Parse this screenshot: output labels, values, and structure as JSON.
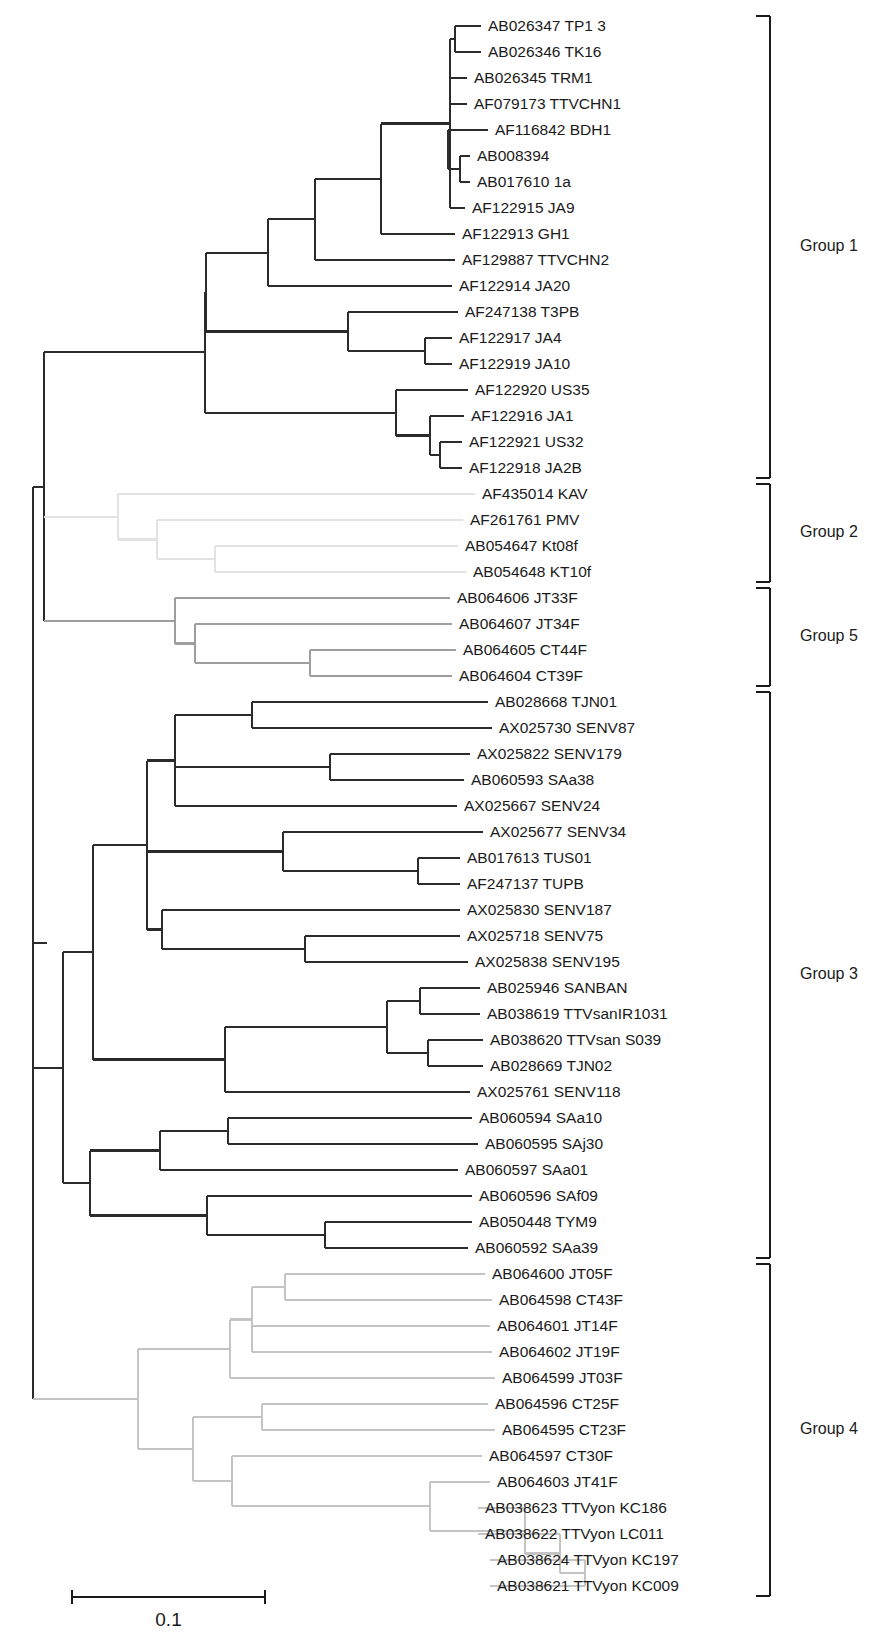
{
  "figure": {
    "type": "phylogenetic-tree",
    "orientation": "rectangular-horizontal-right",
    "scale_bar": {
      "label": "0.1",
      "value": 0.1,
      "x_start": 72,
      "x_end": 265,
      "y": 1597
    },
    "row_spacing_px": 26.0,
    "first_row_y": 26.0,
    "px_per_unit": 1930,
    "colors": {
      "group1": "#2b2b2b",
      "group2": "#e2e2e2",
      "group3": "#2b2b2b",
      "group4": "#c4c4c4",
      "group5": "#9e9e9e",
      "bracket": "#1a1a1a",
      "text": "#1a1a1a",
      "background": "#ffffff"
    }
  },
  "groups": [
    {
      "id": "group1",
      "label": "Group 1",
      "first_row": 1,
      "last_row": 18,
      "color": "#2b2b2b"
    },
    {
      "id": "group2",
      "label": "Group 2",
      "first_row": 19,
      "last_row": 22,
      "color": "#e2e2e2"
    },
    {
      "id": "group5",
      "label": "Group 5",
      "first_row": 23,
      "last_row": 26,
      "color": "#9e9e9e"
    },
    {
      "id": "group3",
      "label": "Group 3",
      "first_row": 27,
      "last_row": 48,
      "color": "#2b2b2b"
    },
    {
      "id": "group4",
      "label": "Group 4",
      "first_row": 49,
      "last_row": 61,
      "color": "#c4c4c4"
    }
  ],
  "taxa": [
    {
      "row": 1,
      "accession": "AB026347",
      "name": "TP1 3",
      "label": "AB026347 TP1 3",
      "group": "group1",
      "tip_x": 481
    },
    {
      "row": 2,
      "accession": "AB026346",
      "name": "TK16",
      "label": "AB026346 TK16",
      "group": "group1",
      "tip_x": 481
    },
    {
      "row": 3,
      "accession": "AB026345",
      "name": "TRM1",
      "label": "AB026345 TRM1",
      "group": "group1",
      "tip_x": 467
    },
    {
      "row": 4,
      "accession": "AF079173",
      "name": "TTVCHN1",
      "label": "AF079173 TTVCHN1",
      "group": "group1",
      "tip_x": 467
    },
    {
      "row": 5,
      "accession": "AF116842",
      "name": "BDH1",
      "label": "AF116842 BDH1",
      "group": "group1",
      "tip_x": 488
    },
    {
      "row": 6,
      "accession": "AB008394",
      "name": "",
      "label": "AB008394",
      "group": "group1",
      "tip_x": 470
    },
    {
      "row": 7,
      "accession": "AB017610",
      "name": "1a",
      "label": "AB017610 1a",
      "group": "group1",
      "tip_x": 470
    },
    {
      "row": 8,
      "accession": "AF122915",
      "name": "JA9",
      "label": "AF122915 JA9",
      "group": "group1",
      "tip_x": 465
    },
    {
      "row": 9,
      "accession": "AF122913",
      "name": "GH1",
      "label": "AF122913 GH1",
      "group": "group1",
      "tip_x": 455
    },
    {
      "row": 10,
      "accession": "AF129887",
      "name": "TTVCHN2",
      "label": "AF129887 TTVCHN2",
      "group": "group1",
      "tip_x": 455
    },
    {
      "row": 11,
      "accession": "AF122914",
      "name": "JA20",
      "label": "AF122914 JA20",
      "group": "group1",
      "tip_x": 452
    },
    {
      "row": 12,
      "accession": "AF247138",
      "name": "T3PB",
      "label": "AF247138 T3PB",
      "group": "group1",
      "tip_x": 458
    },
    {
      "row": 13,
      "accession": "AF122917",
      "name": "JA4",
      "label": "AF122917 JA4",
      "group": "group1",
      "tip_x": 452
    },
    {
      "row": 14,
      "accession": "AF122919",
      "name": "JA10",
      "label": "AF122919 JA10",
      "group": "group1",
      "tip_x": 452
    },
    {
      "row": 15,
      "accession": "AF122920",
      "name": "US35",
      "label": "AF122920 US35",
      "group": "group1",
      "tip_x": 468
    },
    {
      "row": 16,
      "accession": "AF122916",
      "name": "JA1",
      "label": "AF122916 JA1",
      "group": "group1",
      "tip_x": 464
    },
    {
      "row": 17,
      "accession": "AF122921",
      "name": "US32",
      "label": "AF122921 US32",
      "group": "group1",
      "tip_x": 462
    },
    {
      "row": 18,
      "accession": "AF122918",
      "name": "JA2B",
      "label": "AF122918 JA2B",
      "group": "group1",
      "tip_x": 462
    },
    {
      "row": 19,
      "accession": "AF435014",
      "name": "KAV",
      "label": "AF435014 KAV",
      "group": "group2",
      "tip_x": 475
    },
    {
      "row": 20,
      "accession": "AF261761",
      "name": "PMV",
      "label": "AF261761 PMV",
      "group": "group2",
      "tip_x": 463
    },
    {
      "row": 21,
      "accession": "AB054647",
      "name": "Kt08f",
      "label": "AB054647 Kt08f",
      "group": "group2",
      "tip_x": 458
    },
    {
      "row": 22,
      "accession": "AB054648",
      "name": "KT10f",
      "label": "AB054648 KT10f",
      "group": "group2",
      "tip_x": 466
    },
    {
      "row": 23,
      "accession": "AB064606",
      "name": "JT33F",
      "label": "AB064606 JT33F",
      "group": "group5",
      "tip_x": 450
    },
    {
      "row": 24,
      "accession": "AB064607",
      "name": "JT34F",
      "label": "AB064607 JT34F",
      "group": "group5",
      "tip_x": 452
    },
    {
      "row": 25,
      "accession": "AB064605",
      "name": "CT44F",
      "label": "AB064605 CT44F",
      "group": "group5",
      "tip_x": 456
    },
    {
      "row": 26,
      "accession": "AB064604",
      "name": "CT39F",
      "label": "AB064604 CT39F",
      "group": "group5",
      "tip_x": 452
    },
    {
      "row": 27,
      "accession": "AB028668",
      "name": "TJN01",
      "label": "AB028668 TJN01",
      "group": "group3",
      "tip_x": 488
    },
    {
      "row": 28,
      "accession": "AX025730",
      "name": "SENV87",
      "label": "AX025730 SENV87",
      "group": "group3",
      "tip_x": 492
    },
    {
      "row": 29,
      "accession": "AX025822",
      "name": "SENV179",
      "label": "AX025822 SENV179",
      "group": "group3",
      "tip_x": 470
    },
    {
      "row": 30,
      "accession": "AB060593",
      "name": "SAa38",
      "label": "AB060593 SAa38",
      "group": "group3",
      "tip_x": 464
    },
    {
      "row": 31,
      "accession": "AX025667",
      "name": "SENV24",
      "label": "AX025667 SENV24",
      "group": "group3",
      "tip_x": 457
    },
    {
      "row": 32,
      "accession": "AX025677",
      "name": "SENV34",
      "label": "AX025677 SENV34",
      "group": "group3",
      "tip_x": 483
    },
    {
      "row": 33,
      "accession": "AB017613",
      "name": "TUS01",
      "label": "AB017613 TUS01",
      "group": "group3",
      "tip_x": 460
    },
    {
      "row": 34,
      "accession": "AF247137",
      "name": "TUPB",
      "label": "AF247137 TUPB",
      "group": "group3",
      "tip_x": 460
    },
    {
      "row": 35,
      "accession": "AX025830",
      "name": "SENV187",
      "label": "AX025830 SENV187",
      "group": "group3",
      "tip_x": 460
    },
    {
      "row": 36,
      "accession": "AX025718",
      "name": "SENV75",
      "label": "AX025718 SENV75",
      "group": "group3",
      "tip_x": 460
    },
    {
      "row": 37,
      "accession": "AX025838",
      "name": "SENV195",
      "label": "AX025838 SENV195",
      "group": "group3",
      "tip_x": 468
    },
    {
      "row": 38,
      "accession": "AB025946",
      "name": "SANBAN",
      "label": "AB025946 SANBAN",
      "group": "group3",
      "tip_x": 480
    },
    {
      "row": 39,
      "accession": "AB038619",
      "name": "TTVsanIR1031",
      "label": "AB038619 TTVsanIR1031",
      "group": "group3",
      "tip_x": 480
    },
    {
      "row": 40,
      "accession": "AB038620",
      "name": "TTVsan S039",
      "label": "AB038620 TTVsan S039",
      "group": "group3",
      "tip_x": 483
    },
    {
      "row": 41,
      "accession": "AB028669",
      "name": "TJN02",
      "label": "AB028669 TJN02",
      "group": "group3",
      "tip_x": 483
    },
    {
      "row": 42,
      "accession": "AX025761",
      "name": "SENV118",
      "label": "AX025761 SENV118",
      "group": "group3",
      "tip_x": 470
    },
    {
      "row": 43,
      "accession": "AB060594",
      "name": "SAa10",
      "label": "AB060594 SAa10",
      "group": "group3",
      "tip_x": 472
    },
    {
      "row": 44,
      "accession": "AB060595",
      "name": "SAj30",
      "label": "AB060595 SAj30",
      "group": "group3",
      "tip_x": 478
    },
    {
      "row": 45,
      "accession": "AB060597",
      "name": "SAa01",
      "label": "AB060597 SAa01",
      "group": "group3",
      "tip_x": 458
    },
    {
      "row": 46,
      "accession": "AB060596",
      "name": "SAf09",
      "label": "AB060596 SAf09",
      "group": "group3",
      "tip_x": 472
    },
    {
      "row": 47,
      "accession": "AB050448",
      "name": "TYM9",
      "label": "AB050448 TYM9",
      "group": "group3",
      "tip_x": 472
    },
    {
      "row": 48,
      "accession": "AB060592",
      "name": "SAa39",
      "label": "AB060592 SAa39",
      "group": "group3",
      "tip_x": 468
    },
    {
      "row": 49,
      "accession": "AB064600",
      "name": "JT05F",
      "label": "AB064600 JT05F",
      "group": "group4",
      "tip_x": 485
    },
    {
      "row": 50,
      "accession": "AB064598",
      "name": "CT43F",
      "label": "AB064598 CT43F",
      "group": "group4",
      "tip_x": 492
    },
    {
      "row": 51,
      "accession": "AB064601",
      "name": "JT14F",
      "label": "AB064601 JT14F",
      "group": "group4",
      "tip_x": 490
    },
    {
      "row": 52,
      "accession": "AB064602",
      "name": "JT19F",
      "label": "AB064602 JT19F",
      "group": "group4",
      "tip_x": 492
    },
    {
      "row": 53,
      "accession": "AB064599",
      "name": "JT03F",
      "label": "AB064599 JT03F",
      "group": "group4",
      "tip_x": 495
    },
    {
      "row": 54,
      "accession": "AB064596",
      "name": "CT25F",
      "label": "AB064596 CT25F",
      "group": "group4",
      "tip_x": 488
    },
    {
      "row": 55,
      "accession": "AB064595",
      "name": "CT23F",
      "label": "AB064595 CT23F",
      "group": "group4",
      "tip_x": 495
    },
    {
      "row": 56,
      "accession": "AB064597",
      "name": "CT30F",
      "label": "AB064597 CT30F",
      "group": "group4",
      "tip_x": 482
    },
    {
      "row": 57,
      "accession": "AB064603",
      "name": "JT41F",
      "label": "AB064603 JT41F",
      "group": "group4",
      "tip_x": 490
    },
    {
      "row": 58,
      "accession": "AB038623",
      "name": "TTVyon KC186",
      "label": "AB038623 TTVyon KC186",
      "group": "group4",
      "tip_x": 478
    },
    {
      "row": 59,
      "accession": "AB038622",
      "name": "TTVyon LC011",
      "label": "AB038622 TTVyon LC011",
      "group": "group4",
      "tip_x": 478
    },
    {
      "row": 60,
      "accession": "AB038624",
      "name": "TTVyon KC197",
      "label": "AB038624 TTVyon KC197",
      "group": "group4",
      "tip_x": 490
    },
    {
      "row": 61,
      "accession": "AB038621",
      "name": "TTVyon KC009",
      "label": "AB038621 TTVyon KC009",
      "group": "group4",
      "tip_x": 490
    }
  ],
  "internal_nodes": [
    {
      "id": "root",
      "x": 33,
      "children_rows": [
        1,
        61
      ]
    },
    {
      "id": "n_g1g2g5",
      "x": 44,
      "children_rows": [
        1,
        26
      ]
    },
    {
      "id": "n_g1",
      "x": 47,
      "children_rows": [
        1,
        18
      ]
    },
    {
      "id": "n_g1a",
      "x": 205,
      "children_rows": [
        1,
        18
      ]
    },
    {
      "id": "n_g1b",
      "x": 206,
      "children_rows": [
        1,
        11
      ]
    },
    {
      "id": "n_g1c",
      "x": 268,
      "children_rows": [
        1,
        10
      ]
    },
    {
      "id": "n_g1d",
      "x": 315,
      "children_rows": [
        1,
        9
      ]
    },
    {
      "id": "n_g1e",
      "x": 381,
      "children_rows": [
        1,
        8
      ]
    },
    {
      "id": "n_g1f",
      "x": 450,
      "children_rows": [
        1,
        4
      ]
    },
    {
      "id": "n_g1g",
      "x": 455,
      "children_rows": [
        1,
        2
      ]
    },
    {
      "id": "n_g1h",
      "x": 450,
      "children_rows": [
        3,
        4
      ]
    },
    {
      "id": "n_g1i",
      "x": 448,
      "children_rows": [
        5,
        7
      ]
    },
    {
      "id": "n_g1j",
      "x": 460,
      "children_rows": [
        6,
        7
      ]
    },
    {
      "id": "n_g1k",
      "x": 348,
      "children_rows": [
        12,
        14
      ]
    },
    {
      "id": "n_g1l",
      "x": 425,
      "children_rows": [
        13,
        14
      ]
    },
    {
      "id": "n_g1m",
      "x": 396,
      "children_rows": [
        15,
        18
      ]
    },
    {
      "id": "n_g1n",
      "x": 430,
      "children_rows": [
        16,
        18
      ]
    },
    {
      "id": "n_g1o",
      "x": 440,
      "children_rows": [
        17,
        18
      ]
    },
    {
      "id": "n_g2",
      "x": 118,
      "children_rows": [
        19,
        22
      ]
    },
    {
      "id": "n_g2a",
      "x": 157,
      "children_rows": [
        20,
        22
      ]
    },
    {
      "id": "n_g2b",
      "x": 215,
      "children_rows": [
        21,
        22
      ]
    },
    {
      "id": "n_g5",
      "x": 175,
      "children_rows": [
        23,
        26
      ]
    },
    {
      "id": "n_g5a",
      "x": 195,
      "children_rows": [
        24,
        26
      ]
    },
    {
      "id": "n_g5b",
      "x": 310,
      "children_rows": [
        25,
        26
      ]
    },
    {
      "id": "n_g3",
      "x": 63,
      "children_rows": [
        27,
        48
      ]
    },
    {
      "id": "n_g3a",
      "x": 93,
      "children_rows": [
        27,
        42
      ]
    },
    {
      "id": "n_g3b",
      "x": 147,
      "children_rows": [
        27,
        37
      ]
    },
    {
      "id": "n_g3c",
      "x": 175,
      "children_rows": [
        27,
        31
      ]
    },
    {
      "id": "n_g3d",
      "x": 252,
      "children_rows": [
        27,
        28
      ]
    },
    {
      "id": "n_g3e",
      "x": 330,
      "children_rows": [
        29,
        30
      ]
    },
    {
      "id": "n_g3f",
      "x": 283,
      "children_rows": [
        32,
        34
      ]
    },
    {
      "id": "n_g3g",
      "x": 418,
      "children_rows": [
        33,
        34
      ]
    },
    {
      "id": "n_g3h",
      "x": 162,
      "children_rows": [
        35,
        37
      ]
    },
    {
      "id": "n_g3i",
      "x": 305,
      "children_rows": [
        36,
        37
      ]
    },
    {
      "id": "n_g3j",
      "x": 225,
      "children_rows": [
        38,
        42
      ]
    },
    {
      "id": "n_g3k",
      "x": 387,
      "children_rows": [
        38,
        41
      ]
    },
    {
      "id": "n_g3l",
      "x": 420,
      "children_rows": [
        38,
        39
      ]
    },
    {
      "id": "n_g3m",
      "x": 428,
      "children_rows": [
        40,
        41
      ]
    },
    {
      "id": "n_g3n",
      "x": 90,
      "children_rows": [
        43,
        48
      ]
    },
    {
      "id": "n_g3o",
      "x": 160,
      "children_rows": [
        43,
        45
      ]
    },
    {
      "id": "n_g3p",
      "x": 228,
      "children_rows": [
        43,
        44
      ]
    },
    {
      "id": "n_g3q",
      "x": 207,
      "children_rows": [
        46,
        48
      ]
    },
    {
      "id": "n_g3r",
      "x": 325,
      "children_rows": [
        47,
        48
      ]
    },
    {
      "id": "n_g4",
      "x": 138,
      "children_rows": [
        49,
        61
      ]
    },
    {
      "id": "n_g4a",
      "x": 230,
      "children_rows": [
        49,
        53
      ]
    },
    {
      "id": "n_g4b",
      "x": 252,
      "children_rows": [
        49,
        52
      ]
    },
    {
      "id": "n_g4c",
      "x": 285,
      "children_rows": [
        49,
        50
      ]
    },
    {
      "id": "n_g4d",
      "x": 193,
      "children_rows": [
        54,
        61
      ]
    },
    {
      "id": "n_g4e",
      "x": 262,
      "children_rows": [
        54,
        55
      ]
    },
    {
      "id": "n_g4f",
      "x": 232,
      "children_rows": [
        56,
        61
      ]
    },
    {
      "id": "n_g4g",
      "x": 430,
      "children_rows": [
        57,
        61
      ]
    },
    {
      "id": "n_g4h",
      "x": 525,
      "children_rows": [
        58,
        61
      ]
    },
    {
      "id": "n_g4i",
      "x": 560,
      "children_rows": [
        59,
        61
      ]
    },
    {
      "id": "n_g4j",
      "x": 585,
      "children_rows": [
        60,
        61
      ]
    }
  ],
  "bracket": {
    "x": 770,
    "tick_len": 14,
    "label_x": 800
  }
}
